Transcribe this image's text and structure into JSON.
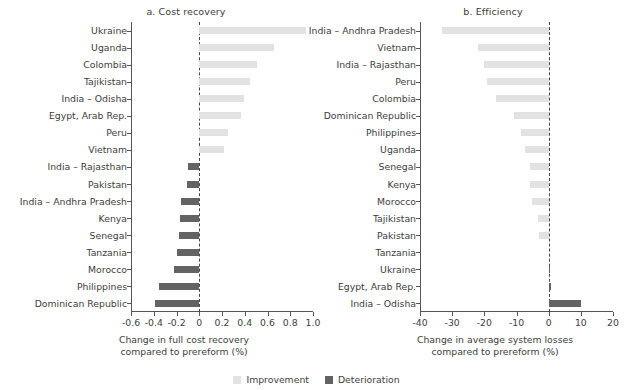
{
  "legend": {
    "improvement_label": "Improvement",
    "deterioration_label": "Deterioration",
    "improvement_color": "#e2e2e2",
    "deterioration_color": "#636363"
  },
  "chart_data": [
    {
      "type": "bar",
      "orientation": "horizontal",
      "title": "a. Cost recovery",
      "xlabel_line1": "Change in full cost recovery",
      "xlabel_line2": "compared to prereform (%)",
      "ylabel": "",
      "xlim": [
        -0.6,
        1.0
      ],
      "xticks": [
        -0.6,
        -0.4,
        -0.2,
        0,
        0.2,
        0.4,
        0.6,
        0.8,
        1.0
      ],
      "xtick_labels": [
        "-0.6",
        "-0.4",
        "-0.2",
        "0",
        "0.2",
        "0.4",
        "0.6",
        "0.8",
        "1.0"
      ],
      "grid": false,
      "zero_reference_line": true,
      "legend_position": "bottom-center",
      "categories": [
        "Ukraine",
        "Uganda",
        "Colombia",
        "Tajikistan",
        "India – Odisha",
        "Egypt, Arab Rep.",
        "Peru",
        "Vietnam",
        "India – Rajasthan",
        "Pakistan",
        "India – Andhra Pradesh",
        "Kenya",
        "Senegal",
        "Tanzania",
        "Morocco",
        "Philippines",
        "Dominican Republic"
      ],
      "values": [
        0.94,
        0.66,
        0.51,
        0.45,
        0.39,
        0.37,
        0.25,
        0.22,
        -0.1,
        -0.11,
        -0.16,
        -0.17,
        -0.18,
        -0.2,
        -0.22,
        -0.35,
        -0.39
      ]
    },
    {
      "type": "bar",
      "orientation": "horizontal",
      "title": "b. Efficiency",
      "xlabel_line1": "Change in average system losses",
      "xlabel_line2": "compared to prereform (%)",
      "ylabel": "",
      "xlim": [
        -40,
        20
      ],
      "xticks": [
        -40,
        -30,
        -20,
        -10,
        0,
        10,
        20
      ],
      "xtick_labels": [
        "-40",
        "-30",
        "-20",
        "-10",
        "0",
        "10",
        "20"
      ],
      "grid": false,
      "zero_reference_line": true,
      "legend_position": "bottom-center",
      "categories": [
        "India – Andhra Pradesh",
        "Vietnam",
        "India – Rajasthan",
        "Peru",
        "Colombia",
        "Dominican Republic",
        "Philippines",
        "Uganda",
        "Senegal",
        "Kenya",
        "Morocco",
        "Tajikistan",
        "Pakistan",
        "Tanzania",
        "Ukraine",
        "Egypt, Arab Rep.",
        "India – Odisha"
      ],
      "values": [
        -33.3,
        -22,
        -20,
        -19.3,
        -16.3,
        -10.7,
        -8.7,
        -7.3,
        -5.7,
        -5.7,
        -5.3,
        -3.3,
        -3,
        0,
        0.5,
        0.6,
        10
      ]
    }
  ]
}
